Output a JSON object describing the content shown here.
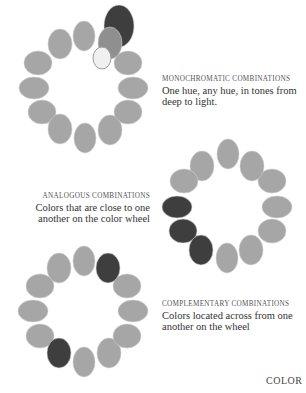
{
  "colors": {
    "base": "#a6a6a6",
    "dark": "#3e3e3e",
    "medium": "#8f8f8f",
    "light": "#f0f0f0",
    "outline": "#cfcfcf"
  },
  "wheels": [
    {
      "name": "monochromatic",
      "ellipses": [
        {
          "cx": 84,
          "cy": 36,
          "rx": 11,
          "ry": 15,
          "tone": "base"
        },
        {
          "cx": 60,
          "cy": 44,
          "rx": 12,
          "ry": 15,
          "tone": "base"
        },
        {
          "cx": 38,
          "cy": 63,
          "rx": 14,
          "ry": 12,
          "tone": "base"
        },
        {
          "cx": 34,
          "cy": 88,
          "rx": 15,
          "ry": 11,
          "tone": "base"
        },
        {
          "cx": 42,
          "cy": 112,
          "rx": 14,
          "ry": 12,
          "tone": "base"
        },
        {
          "cx": 60,
          "cy": 129,
          "rx": 12,
          "ry": 15,
          "tone": "base"
        },
        {
          "cx": 85,
          "cy": 138,
          "rx": 11,
          "ry": 15,
          "tone": "base"
        },
        {
          "cx": 110,
          "cy": 130,
          "rx": 12,
          "ry": 15,
          "tone": "base"
        },
        {
          "cx": 128,
          "cy": 112,
          "rx": 14,
          "ry": 12,
          "tone": "base"
        },
        {
          "cx": 133,
          "cy": 88,
          "rx": 15,
          "ry": 11,
          "tone": "base"
        },
        {
          "cx": 128,
          "cy": 63,
          "rx": 14,
          "ry": 12,
          "tone": "base"
        },
        {
          "cx": 119,
          "cy": 26,
          "rx": 15,
          "ry": 21,
          "tone": "dark"
        },
        {
          "cx": 110,
          "cy": 43,
          "rx": 12,
          "ry": 16,
          "tone": "medium"
        },
        {
          "cx": 102,
          "cy": 58,
          "rx": 9,
          "ry": 11,
          "tone": "light"
        }
      ]
    },
    {
      "name": "analogous",
      "ellipses": [
        {
          "cx": 228,
          "cy": 154,
          "rx": 11,
          "ry": 15,
          "tone": "base"
        },
        {
          "cx": 202,
          "cy": 166,
          "rx": 12,
          "ry": 15,
          "tone": "base"
        },
        {
          "cx": 184,
          "cy": 181,
          "rx": 14,
          "ry": 12,
          "tone": "base"
        },
        {
          "cx": 177,
          "cy": 207,
          "rx": 15,
          "ry": 11,
          "tone": "dark"
        },
        {
          "cx": 183,
          "cy": 231,
          "rx": 14,
          "ry": 12,
          "tone": "dark"
        },
        {
          "cx": 201,
          "cy": 250,
          "rx": 12,
          "ry": 15,
          "tone": "dark"
        },
        {
          "cx": 227,
          "cy": 258,
          "rx": 11,
          "ry": 15,
          "tone": "base"
        },
        {
          "cx": 251,
          "cy": 250,
          "rx": 12,
          "ry": 15,
          "tone": "base"
        },
        {
          "cx": 272,
          "cy": 231,
          "rx": 14,
          "ry": 12,
          "tone": "base"
        },
        {
          "cx": 277,
          "cy": 207,
          "rx": 15,
          "ry": 11,
          "tone": "base"
        },
        {
          "cx": 272,
          "cy": 181,
          "rx": 14,
          "ry": 12,
          "tone": "base"
        },
        {
          "cx": 252,
          "cy": 166,
          "rx": 12,
          "ry": 15,
          "tone": "base"
        }
      ]
    },
    {
      "name": "complementary",
      "ellipses": [
        {
          "cx": 84,
          "cy": 261,
          "rx": 11,
          "ry": 15,
          "tone": "base"
        },
        {
          "cx": 59,
          "cy": 268,
          "rx": 12,
          "ry": 15,
          "tone": "base"
        },
        {
          "cx": 40,
          "cy": 286,
          "rx": 14,
          "ry": 12,
          "tone": "base"
        },
        {
          "cx": 33,
          "cy": 311,
          "rx": 15,
          "ry": 11,
          "tone": "base"
        },
        {
          "cx": 40,
          "cy": 336,
          "rx": 14,
          "ry": 12,
          "tone": "base"
        },
        {
          "cx": 59,
          "cy": 353,
          "rx": 12,
          "ry": 15,
          "tone": "dark"
        },
        {
          "cx": 84,
          "cy": 362,
          "rx": 11,
          "ry": 15,
          "tone": "base"
        },
        {
          "cx": 109,
          "cy": 353,
          "rx": 12,
          "ry": 15,
          "tone": "base"
        },
        {
          "cx": 127,
          "cy": 336,
          "rx": 14,
          "ry": 12,
          "tone": "base"
        },
        {
          "cx": 133,
          "cy": 311,
          "rx": 15,
          "ry": 11,
          "tone": "base"
        },
        {
          "cx": 127,
          "cy": 286,
          "rx": 14,
          "ry": 12,
          "tone": "base"
        },
        {
          "cx": 108,
          "cy": 268,
          "rx": 12,
          "ry": 15,
          "tone": "dark"
        }
      ]
    }
  ],
  "captions": {
    "monochromatic": {
      "heading": "MONOCHROMATIC COMBINATIONS",
      "body": "One hue, any hue, in tones from deep to light."
    },
    "analogous": {
      "heading": "ANALOGOUS COMBINATIONS",
      "body": "Colors that are close to one another on the color wheel"
    },
    "complementary": {
      "heading": "COMPLEMENTARY COMBINATIONS",
      "body": "Colors located across from one another on the wheel"
    }
  },
  "page_label": "COLOR"
}
